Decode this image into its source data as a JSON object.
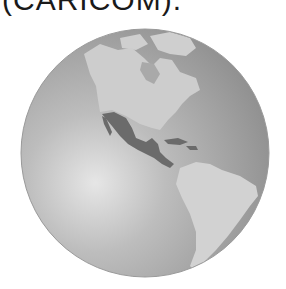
{
  "caption": "(CARICOM).",
  "figure": {
    "highlighted_region": "Mexico, Central America and the Caribbean",
    "colors": {
      "ocean_light": "#e2e2e2",
      "ocean_dark": "#8f8f8f",
      "land": "#cdcdcd",
      "highlight": "#6b6b6b",
      "background": "#ffffff"
    }
  }
}
